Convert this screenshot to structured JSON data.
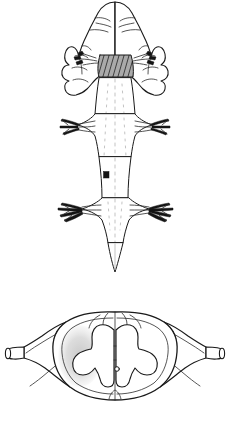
{
  "figure": {
    "background_color": "#ffffff",
    "ink_color": "#1a1a1a",
    "width_px": 231,
    "height_px": 441,
    "panels": [
      {
        "id": "dorsal-view",
        "label": "Dorsal view of brainstem and spinal cord",
        "bounds": {
          "x": 0,
          "y": 0,
          "width": 231,
          "height": 290
        },
        "parts": [
          {
            "name": "cerebral-hemispheres",
            "label": "Cerebral hemispheres",
            "shading": "outline"
          },
          {
            "name": "cerebellum",
            "label": "Cerebellum",
            "shading": "outline"
          },
          {
            "name": "medulla-hatched-band",
            "label": "Hatched medullary band",
            "shading": "cross-hatched",
            "color": "#1b1b1b"
          },
          {
            "name": "dorsal-root-ganglia-upper",
            "label": "Upper dorsal root ganglia",
            "shading": "solid",
            "color": "#141414"
          },
          {
            "name": "cervical-enlargement",
            "label": "Cervical enlargement",
            "shading": "outline"
          },
          {
            "name": "lumbar-enlargement",
            "label": "Lumbar enlargement",
            "shading": "outline"
          },
          {
            "name": "section-level-marker",
            "label": "Transverse section level marker",
            "shading": "solid",
            "color": "#141414"
          },
          {
            "name": "filum-terminale",
            "label": "Filum terminale",
            "shading": "outline"
          }
        ]
      },
      {
        "id": "transverse-section",
        "label": "Transverse section of spinal cord with dural sleeves",
        "bounds": {
          "x": 0,
          "y": 300,
          "width": 231,
          "height": 141
        },
        "parts": [
          {
            "name": "white-matter",
            "label": "White matter",
            "shading": "outline"
          },
          {
            "name": "gray-matter-butterfly",
            "label": "Gray matter (butterfly)",
            "shading": "outline"
          },
          {
            "name": "stippled-lesion-area",
            "label": "Stippled area, left anterolateral quadrant",
            "shading": "stipple",
            "color": "#c9c9c9"
          },
          {
            "name": "central-canal",
            "label": "Central canal",
            "shading": "outline"
          },
          {
            "name": "posterior-median-sulcus",
            "label": "Posterior median sulcus",
            "shading": "outline"
          },
          {
            "name": "anterior-median-fissure",
            "label": "Anterior median fissure",
            "shading": "outline"
          },
          {
            "name": "dural-sleeve-left",
            "label": "Left dural root sleeve",
            "shading": "outline"
          },
          {
            "name": "dural-sleeve-right",
            "label": "Right dural root sleeve",
            "shading": "outline"
          },
          {
            "name": "cut-nerve-stump-left",
            "label": "Left cut nerve stump",
            "shading": "outline"
          },
          {
            "name": "cut-nerve-stump-right",
            "label": "Right cut nerve stump",
            "shading": "outline"
          }
        ]
      }
    ]
  }
}
